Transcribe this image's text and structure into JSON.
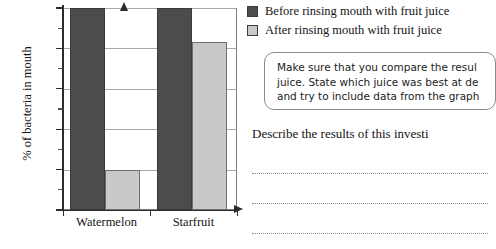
{
  "chart_data": {
    "type": "bar",
    "title": "",
    "xlabel": "",
    "ylabel": "% of bacteria in mouth",
    "categories": [
      "Watermelon",
      "Starfruit"
    ],
    "series": [
      {
        "name": "Before rinsing mouth with fruit juice",
        "values": [
          100,
          100
        ],
        "color": "#4c4c4c"
      },
      {
        "name": "After rinsing mouth with fruit juice",
        "values": [
          20,
          83
        ],
        "color": "#c9c9c9"
      }
    ],
    "ylim": [
      0,
      100
    ],
    "ytick_labels": [
      "0%",
      "20%",
      "40%",
      "60%",
      "80%",
      "100%"
    ],
    "ytick_values": [
      0,
      20,
      40,
      60,
      80,
      100
    ],
    "yminor_values": [
      10,
      30,
      50,
      70,
      90
    ],
    "grid": true,
    "legend_position": "top-right",
    "units": "%"
  },
  "legend": {
    "items": [
      {
        "label": "Before rinsing mouth with fruit juice",
        "swatch": "dark"
      },
      {
        "label": "After rinsing mouth with fruit juice",
        "swatch": "light"
      }
    ]
  },
  "callout": {
    "lines": [
      "Make sure that you compare the resul",
      "juice. State which juice was best at de",
      "and try to include data from the graph"
    ]
  },
  "question": {
    "prompt": "Describe the results of this investi",
    "answer_lines": 3
  }
}
